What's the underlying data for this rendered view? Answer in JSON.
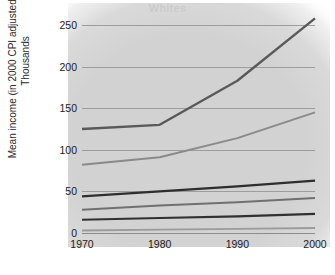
{
  "chart_data": {
    "type": "line",
    "title": "Whites",
    "xlabel": "",
    "ylabel": "Mean income (in 2000 CPI adjusted dollars)",
    "ylabel_line2": "Thousands",
    "x": [
      1970,
      1980,
      1990,
      2000
    ],
    "xtick_labels": [
      "1970",
      "1980",
      "1990",
      "2000"
    ],
    "ytick_labels": [
      "0",
      "50",
      "100",
      "150",
      "200",
      "250"
    ],
    "yticks": [
      0,
      50,
      100,
      150,
      200,
      250
    ],
    "ylim": [
      0,
      262
    ],
    "xlim": [
      1970,
      2000
    ],
    "grid": true,
    "legend": "none",
    "plot_background": "#d4d4d4",
    "gridline_color": "#9d9d9d",
    "series": [
      {
        "name": "Top quintile upper limit",
        "values": [
          125,
          130,
          183,
          258
        ],
        "color": "#5a5a5a",
        "width": 2.4
      },
      {
        "name": "Fourth quintile upper limit",
        "values": [
          82,
          91,
          114,
          145
        ],
        "color": "#8a8a8a",
        "width": 2.0
      },
      {
        "name": "Third quintile upper limit",
        "values": [
          44,
          50,
          56,
          63
        ],
        "color": "#2e2e2e",
        "width": 2.4
      },
      {
        "name": "Second quintile upper limit",
        "values": [
          28,
          33,
          37,
          42
        ],
        "color": "#707070",
        "width": 1.9
      },
      {
        "name": "First quintile upper limit",
        "values": [
          16,
          18,
          20,
          23
        ],
        "color": "#303030",
        "width": 2.1
      },
      {
        "name": "Lowest bound",
        "values": [
          3,
          4,
          5,
          6
        ],
        "color": "#9b9b9b",
        "width": 1.8
      }
    ]
  }
}
